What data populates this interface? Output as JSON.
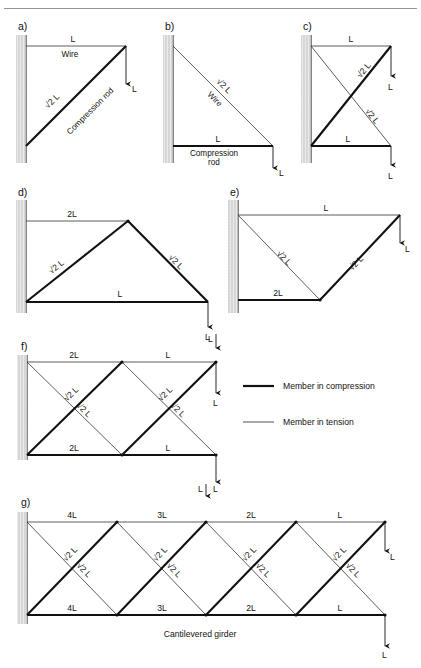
{
  "page": {
    "top_rule": true,
    "legend": {
      "compression_label": "Member in compression",
      "tension_label": "Member in tension"
    },
    "caption_g": "Cantilevered girder"
  },
  "panels": {
    "a": {
      "tag": "a)",
      "labels": {
        "top_chord": "L",
        "top_chord_note": "Wire",
        "diagonal": "√2 L",
        "diagonal_note": "Compression rod",
        "load": "L"
      }
    },
    "b": {
      "tag": "b)",
      "labels": {
        "diagonal": "√2 L",
        "diagonal_note": "Wire",
        "bottom_chord": "L",
        "bottom_chord_note_1": "Compression",
        "bottom_chord_note_2": "rod",
        "load": "L"
      }
    },
    "c": {
      "tag": "c)",
      "labels": {
        "top_chord": "L",
        "bottom_chord": "L",
        "diagonal_1": "√2 L",
        "diagonal_2": "√2 L",
        "load_top": "L",
        "load_bottom": "L"
      }
    },
    "d": {
      "tag": "d)",
      "labels": {
        "top_chord": "2L",
        "bottom_chord": "L",
        "diagonal_left": "√2 L",
        "diagonal_right": "√2 L",
        "load": "L"
      }
    },
    "e": {
      "tag": "e)",
      "labels": {
        "top_chord": "L",
        "bottom_chord": "2L",
        "diagonal_left": "√2 L",
        "diagonal_right": "√2 L",
        "load": "L"
      }
    },
    "f": {
      "tag": "f)",
      "labels": {
        "top_chord_1": "2L",
        "top_chord_2": "L",
        "bottom_chord_1": "2L",
        "bottom_chord_2": "L",
        "diag_a1": "√2 L",
        "diag_a2": "√2 L",
        "diag_b1": "√2 L",
        "diag_b2": "√2 L",
        "load_top": "L",
        "load_mid": "L",
        "load_bottom": "L"
      }
    },
    "g": {
      "tag": "g)",
      "labels": {
        "top_chord_1": "4L",
        "top_chord_2": "3L",
        "top_chord_3": "2L",
        "top_chord_4": "L",
        "bottom_chord_1": "4L",
        "bottom_chord_2": "3L",
        "bottom_chord_3": "2L",
        "bottom_chord_4": "L",
        "diag_1a": "√2 L",
        "diag_1b": "√2 L",
        "diag_2a": "√2 L",
        "diag_2b": "√2 L",
        "diag_3a": "√2 L",
        "diag_3b": "√2 L",
        "diag_4a": "√2 L",
        "diag_4b": "√2 L",
        "load_top": "L",
        "load_right": "L",
        "load_bottom": "L"
      }
    }
  },
  "colors": {
    "ink": "#111111",
    "rule": "#8a8a8a",
    "wall_light": "#f0f0f0",
    "wall_dark": "#b8b8b8"
  }
}
